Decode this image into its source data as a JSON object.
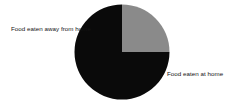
{
  "chart_data": {
    "type": "pie",
    "title": "",
    "categories": [
      "Food eaten at home",
      "Food eaten away from home"
    ],
    "values": [
      75,
      25
    ],
    "labels": [
      "Food eaten at home",
      "Food eaten away from home"
    ],
    "units": "percent",
    "colors": [
      "#0a0a0a",
      "#8a8a8a"
    ],
    "background_color": "#ffffff",
    "label_color": "#141414",
    "legend": "none",
    "annotations": [
      {
        "name": "Food eaten away from home",
        "position": "left",
        "value": 25
      },
      {
        "name": "Food eaten at home",
        "position": "right",
        "value": 75
      }
    ],
    "start_angle_deg": 90,
    "direction": "clockwise",
    "geometry": {
      "cx": 122,
      "cy": 52,
      "r": 47.5
    }
  },
  "labels": {
    "away_from_home": "Food eaten away from home",
    "at_home": "Food eaten at home"
  }
}
